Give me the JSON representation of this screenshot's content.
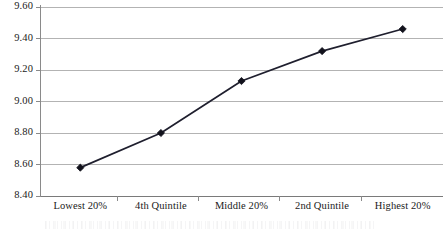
{
  "chart_data": {
    "type": "line",
    "title": "",
    "subtitle": "",
    "xlabel": "",
    "ylabel": "",
    "categories": [
      "Lowest 20%",
      "4th Quintile",
      "Middle 20%",
      "2nd Quintile",
      "Highest 20%"
    ],
    "values": [
      8.58,
      8.8,
      9.13,
      9.32,
      9.46
    ],
    "series": [
      {
        "name": "",
        "values": [
          8.58,
          8.8,
          9.13,
          9.32,
          9.46
        ]
      }
    ],
    "ylim": [
      8.4,
      9.6
    ],
    "ystep": 0.2,
    "yticks": [
      "9.60",
      "9.40",
      "9.20",
      "9.00",
      "8.80",
      "8.60",
      "8.40"
    ],
    "ytick_values": [
      9.6,
      9.4,
      9.2,
      9.0,
      8.8,
      8.6,
      8.4
    ],
    "grid": "horizontal",
    "legend": "none",
    "marker": "diamond",
    "line_color": "#1f1f2e",
    "marker_color": "#12121c",
    "grid_color": "#b3b3b3",
    "axis_color": "#7a7a7a",
    "text_color": "#1a1a1a",
    "background": "#ffffff"
  }
}
